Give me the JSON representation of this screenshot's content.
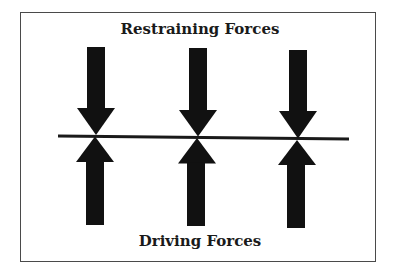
{
  "diagram": {
    "title_top": "Restraining Forces",
    "title_bottom": "Driving Forces",
    "colors": {
      "arrow": "#111111",
      "line": "#1a1a1a",
      "frame": "#4a4a4a",
      "background": "#ffffff"
    },
    "restraining_arrows": [
      {
        "id": "restraining-1",
        "direction": "down"
      },
      {
        "id": "restraining-2",
        "direction": "down"
      },
      {
        "id": "restraining-3",
        "direction": "down"
      }
    ],
    "driving_arrows": [
      {
        "id": "driving-1",
        "direction": "up"
      },
      {
        "id": "driving-2",
        "direction": "up"
      },
      {
        "id": "driving-3",
        "direction": "up"
      }
    ]
  }
}
